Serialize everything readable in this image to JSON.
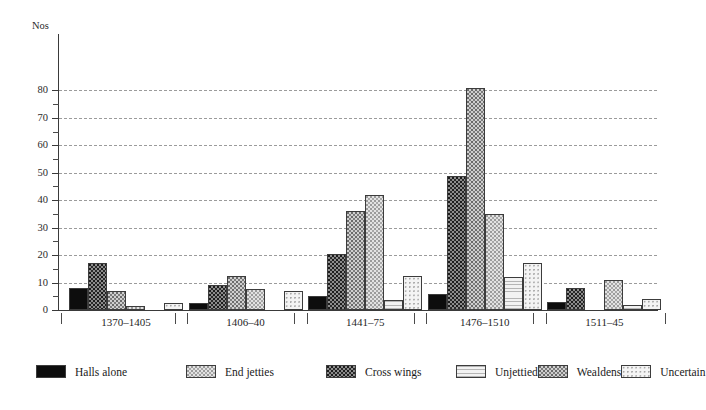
{
  "chart_data": {
    "type": "bar",
    "title": "",
    "xlabel": "",
    "ylabel": "Nos",
    "ylim": [
      0,
      85
    ],
    "yticks": [
      0,
      10,
      20,
      30,
      40,
      50,
      60,
      70,
      80
    ],
    "grid": true,
    "legend_position": "bottom-left",
    "categories": [
      "1370–1405",
      "1406–40",
      "1441–75",
      "1476–1510",
      "1511–45"
    ],
    "series": [
      {
        "name": "Halls alone",
        "pattern": "solid-black",
        "values": [
          8,
          2.5,
          5,
          6,
          3
        ]
      },
      {
        "name": "Cross wings",
        "pattern": "dense-dots",
        "values": [
          17,
          9,
          20.5,
          49,
          8
        ]
      },
      {
        "name": "Wealdens",
        "pattern": "medium-dots",
        "values": [
          7,
          12.5,
          36,
          81,
          0
        ]
      },
      {
        "name": "End jetties",
        "pattern": "light-dots",
        "values": [
          1.5,
          7.5,
          42,
          35,
          11
        ]
      },
      {
        "name": "Unjettied",
        "pattern": "horiz-lines",
        "values": [
          0,
          0,
          3.5,
          12,
          2
        ]
      },
      {
        "name": "Uncertain",
        "pattern": "sparse-dots",
        "values": [
          2.5,
          7,
          12.5,
          17,
          4
        ]
      }
    ]
  },
  "axis": {
    "y_title": "Nos",
    "y_tick_labels": [
      "0",
      "10",
      "20",
      "30",
      "40",
      "50",
      "60",
      "70",
      "80"
    ],
    "x_tick_labels": [
      "1370–1405",
      "1406–40",
      "1441–75",
      "1476–1510",
      "1511–45"
    ]
  },
  "legend": {
    "items": [
      {
        "label": "Halls alone"
      },
      {
        "label": "End jetties"
      },
      {
        "label": "Cross wings"
      },
      {
        "label": "Unjettied"
      },
      {
        "label": "Wealdens"
      },
      {
        "label": "Uncertain"
      }
    ]
  }
}
